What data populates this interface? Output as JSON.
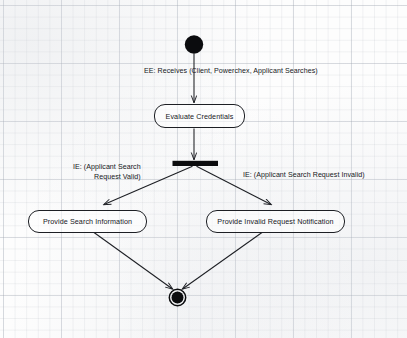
{
  "diagram": {
    "type": "uml-activity-diagram",
    "background": "graph-paper-grid",
    "colors": {
      "stroke": "#1d1f24",
      "fill_node": "#000000",
      "paper": "#fdfdfd",
      "grid_minor": "#aab0ba",
      "grid_major": "#969eac"
    },
    "nodes": [
      {
        "id": "start",
        "kind": "initial-node",
        "label": ""
      },
      {
        "id": "evaluate_credentials",
        "kind": "activity",
        "label": "Evaluate Credentials"
      },
      {
        "id": "fork",
        "kind": "fork-bar",
        "label": ""
      },
      {
        "id": "provide_search_information",
        "kind": "activity",
        "label": "Provide Search Information"
      },
      {
        "id": "provide_invalid_request_notification",
        "kind": "activity",
        "label": "Provide Invalid Request Notification"
      },
      {
        "id": "end",
        "kind": "final-node",
        "label": ""
      }
    ],
    "edges": [
      {
        "id": "edge_start_to_evaluate",
        "from": "start",
        "to": "evaluate_credentials",
        "label": "EE: Receives (Client, Powerchex, Applicant Searches)"
      },
      {
        "id": "edge_evaluate_to_fork",
        "from": "evaluate_credentials",
        "to": "fork",
        "label": ""
      },
      {
        "id": "edge_fork_to_search",
        "from": "fork",
        "to": "provide_search_information",
        "label_line1": "IE: (Applicant Search",
        "label_line2": "Request Valid)"
      },
      {
        "id": "edge_fork_to_invalid",
        "from": "fork",
        "to": "provide_invalid_request_notification",
        "label": "IE: (Applicant Search Request Invalid)"
      },
      {
        "id": "edge_search_to_end",
        "from": "provide_search_information",
        "to": "end",
        "label": ""
      },
      {
        "id": "edge_invalid_to_end",
        "from": "provide_invalid_request_notification",
        "to": "end",
        "label": ""
      }
    ]
  }
}
